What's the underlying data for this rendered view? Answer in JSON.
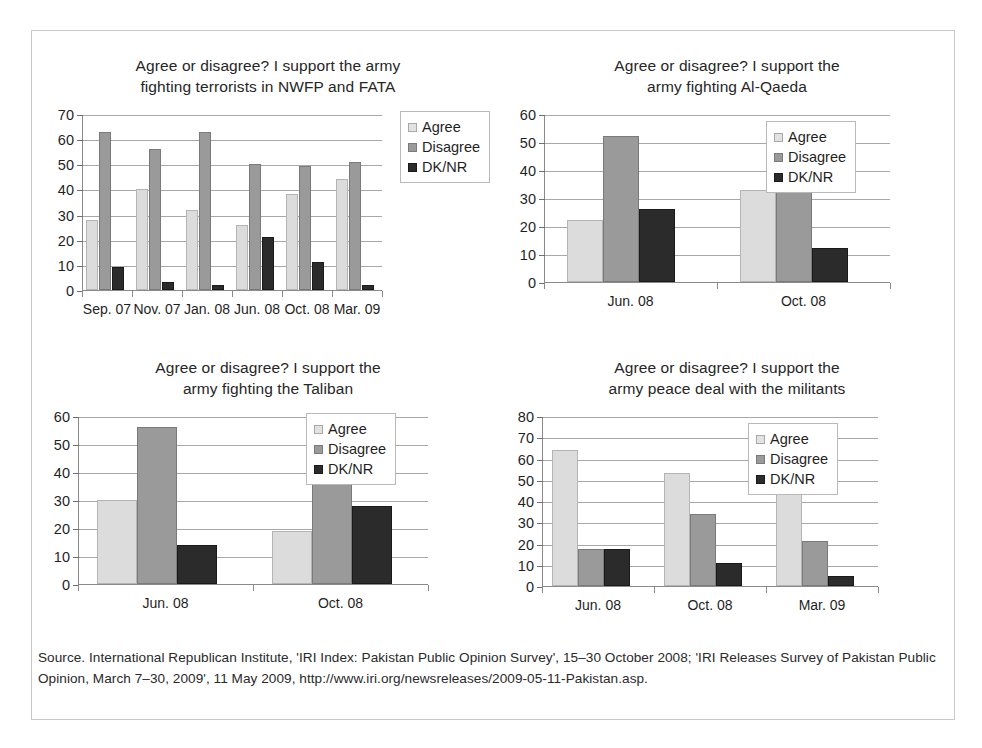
{
  "legend": {
    "items": [
      {
        "label": "Agree",
        "key": "agree",
        "color": "#dcdcdc"
      },
      {
        "label": "Disagree",
        "key": "disagree",
        "color": "#9a9a9a"
      },
      {
        "label": "DK/NR",
        "key": "dknr",
        "color": "#2b2b2b"
      }
    ]
  },
  "source_note": "Source. International Republican Institute, 'IRI Index: Pakistan Public Opinion Survey', 15–30 October 2008; 'IRI Releases Survey of Pakistan Public Opinion, March 7–30, 2009', 11 May 2009, http://www.iri.org/newsreleases/2009-05-11-Pakistan.asp.",
  "charts": [
    {
      "id": "nwfp-fata",
      "title_line1": "Agree or disagree? I support the army",
      "title_line2": "fighting terrorists in NWFP and FATA"
    },
    {
      "id": "al-qaeda",
      "title_line1": "Agree or disagree? I support the",
      "title_line2": "army fighting Al-Qaeda"
    },
    {
      "id": "taliban",
      "title_line1": "Agree or disagree? I support the",
      "title_line2": "army fighting the Taliban"
    },
    {
      "id": "peace-deal",
      "title_line1": "Agree or disagree? I support the",
      "title_line2": "army peace deal with the militants"
    }
  ],
  "chart_data": [
    {
      "type": "bar",
      "id": "nwfp-fata",
      "title": "Agree or disagree? I support the army fighting terrorists in NWFP and FATA",
      "xlabel": "",
      "ylabel": "",
      "ylim": [
        0,
        70
      ],
      "yticks": [
        0,
        10,
        20,
        30,
        40,
        50,
        60,
        70
      ],
      "grid": true,
      "legend_position": "right",
      "categories": [
        "Sep. 07",
        "Nov. 07",
        "Jan. 08",
        "Jun. 08",
        "Oct. 08",
        "Mar. 09"
      ],
      "series": [
        {
          "name": "Agree",
          "values": [
            28,
            40,
            32,
            26,
            38,
            44
          ]
        },
        {
          "name": "Disagree",
          "values": [
            63,
            56,
            63,
            50,
            49.5,
            51
          ]
        },
        {
          "name": "DK/NR",
          "values": [
            9,
            3,
            2,
            21,
            11,
            2
          ]
        }
      ]
    },
    {
      "type": "bar",
      "id": "al-qaeda",
      "title": "Agree or disagree? I support the army fighting Al-Qaeda",
      "xlabel": "",
      "ylabel": "",
      "ylim": [
        0,
        60
      ],
      "yticks": [
        0,
        10,
        20,
        30,
        40,
        50,
        60
      ],
      "grid": true,
      "legend_position": "top-right",
      "categories": [
        "Jun. 08",
        "Oct. 08"
      ],
      "series": [
        {
          "name": "Agree",
          "values": [
            22,
            33
          ]
        },
        {
          "name": "Disagree",
          "values": [
            52,
            51
          ]
        },
        {
          "name": "DK/NR",
          "values": [
            26,
            12
          ]
        }
      ]
    },
    {
      "type": "bar",
      "id": "taliban",
      "title": "Agree or disagree? I support the army fighting the Taliban",
      "xlabel": "",
      "ylabel": "",
      "ylim": [
        0,
        60
      ],
      "yticks": [
        0,
        10,
        20,
        30,
        40,
        50,
        60
      ],
      "grid": true,
      "legend_position": "top-right",
      "categories": [
        "Jun. 08",
        "Oct. 08"
      ],
      "series": [
        {
          "name": "Agree",
          "values": [
            30,
            19
          ]
        },
        {
          "name": "Disagree",
          "values": [
            56,
            50
          ]
        },
        {
          "name": "DK/NR",
          "values": [
            14,
            28
          ]
        }
      ]
    },
    {
      "type": "bar",
      "id": "peace-deal",
      "title": "Agree or disagree? I support the army peace deal with the militants",
      "xlabel": "",
      "ylabel": "",
      "ylim": [
        0,
        80
      ],
      "yticks": [
        0,
        10,
        20,
        30,
        40,
        50,
        60,
        70,
        80
      ],
      "grid": true,
      "legend_position": "top-right",
      "categories": [
        "Jun. 08",
        "Oct. 08",
        "Mar. 09"
      ],
      "series": [
        {
          "name": "Agree",
          "values": [
            64,
            53,
            71
          ]
        },
        {
          "name": "Disagree",
          "values": [
            17.5,
            34,
            21
          ]
        },
        {
          "name": "DK/NR",
          "values": [
            17.5,
            11,
            4.5
          ]
        }
      ]
    }
  ]
}
